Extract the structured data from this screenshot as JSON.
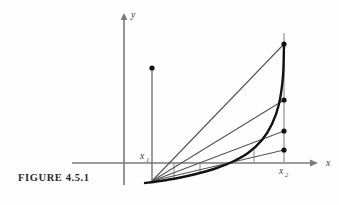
{
  "figure": {
    "caption": "FIGURE 4.5.1",
    "background_color": "#fefefe",
    "ink_color": "#2a2a2a",
    "axis_color": "#7a7a7a",
    "curve_color": "#111111",
    "chord_color": "#555555"
  },
  "labels": {
    "y_axis": "y",
    "x_axis": "x",
    "x1_base": "x",
    "x1_sub": "1",
    "x2_base": "x",
    "x2_sub": "2"
  },
  "chart_data": {
    "type": "line",
    "title": "FIGURE 4.5.1",
    "xlabel": "x",
    "ylabel": "y",
    "grid": false,
    "legend": null,
    "axes": {
      "y_axis_x_px": 124,
      "y_axis_top_px": 13,
      "y_axis_bottom_px": 185,
      "x_axis_y_px": 163,
      "x_axis_left_px": 72,
      "x_axis_right_px": 318
    },
    "markers": {
      "x1_px": 152,
      "x2_px": 284
    },
    "curve_points": [
      [
        145,
        183
      ],
      [
        160,
        181
      ],
      [
        178,
        178
      ],
      [
        196,
        174
      ],
      [
        214,
        169
      ],
      [
        232,
        162
      ],
      [
        248,
        153
      ],
      [
        262,
        140
      ],
      [
        272,
        124
      ],
      [
        279,
        104
      ],
      [
        283,
        76
      ],
      [
        284,
        44
      ]
    ],
    "chord_origin": [
      152,
      181
    ],
    "chords": [
      {
        "name": "chord-1",
        "to": [
          284,
          44
        ]
      },
      {
        "name": "chord-2",
        "to": [
          284,
          100
        ]
      },
      {
        "name": "chord-3",
        "to": [
          284,
          131
        ]
      },
      {
        "name": "chord-4",
        "to": [
          284,
          150
        ]
      }
    ],
    "dots": [
      {
        "name": "dot-top",
        "x": 284,
        "y": 44
      },
      {
        "name": "dot-second",
        "x": 284,
        "y": 100
      },
      {
        "name": "dot-third",
        "x": 284,
        "y": 131
      },
      {
        "name": "dot-fourth",
        "x": 284,
        "y": 150
      },
      {
        "name": "dot-x1-top",
        "x": 152,
        "y": 68
      }
    ],
    "ordinate_ticks": [
      {
        "x": 174,
        "y_top": 163,
        "y_bottom": 178
      },
      {
        "x": 200,
        "y_top": 163,
        "y_bottom": 173
      },
      {
        "x": 228,
        "y_top": 163,
        "y_bottom": 164
      },
      {
        "x": 254,
        "y_top": 163,
        "y_bottom": 149
      }
    ],
    "vertical_at_x1": {
      "x": 152,
      "y_top": 68,
      "y_bottom": 182
    },
    "vertical_at_x2": {
      "x": 284,
      "y_top": 33,
      "y_bottom": 163
    }
  }
}
